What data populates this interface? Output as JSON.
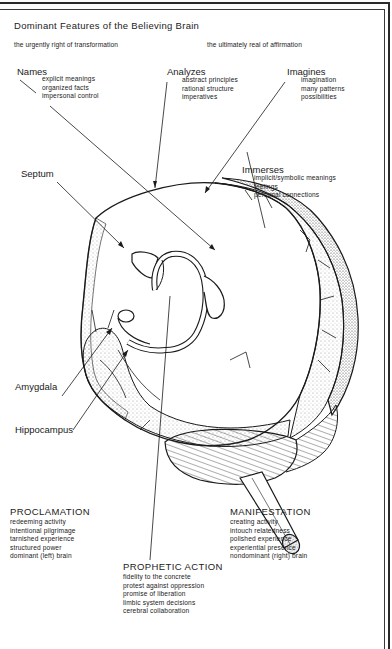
{
  "title": "Dominant Features of the Believing Brain",
  "subtitles": {
    "left": "the urgently right of transformation",
    "right": "the ultimately real of affirmation"
  },
  "callouts": {
    "names": {
      "heading": "Names",
      "items": [
        "explicit meanings",
        "organized facts",
        "impersonal control"
      ]
    },
    "analyzes": {
      "heading": "Analyzes",
      "items": [
        "abstract principles",
        "rational structure",
        "imperatives"
      ]
    },
    "imagines": {
      "heading": "Imagines",
      "items": [
        "imagination",
        "many patterns",
        "possibilities"
      ]
    },
    "immerses": {
      "heading": "Immerses",
      "items": [
        "implicit/symbolic meanings",
        "feelings",
        "personal connections"
      ]
    }
  },
  "anatomy_labels": {
    "septum": "Septum",
    "amygdala": "Amygdala",
    "hippocampus": "Hippocampus"
  },
  "sections": {
    "proclamation": {
      "heading": "PROCLAMATION",
      "items": [
        "redeeming activity",
        "intentional pilgrimage",
        "tarnished experience",
        "structured power",
        "dominant (left) brain"
      ]
    },
    "manifestation": {
      "heading": "MANIFESTATION",
      "items": [
        "creating activity",
        "intouch relatedness",
        "polished experience",
        "experiential presence",
        "nondominant (right) brain"
      ]
    },
    "prophetic_action": {
      "heading": "PROPHETIC ACTION",
      "items": [
        "fidelity to the concrete",
        "protest against oppression",
        "promise of liberation",
        "limbic system decisions",
        "cerebral collaboration"
      ]
    }
  },
  "colors": {
    "ink": "#1a1a1a",
    "paper": "#ffffff",
    "stipple": "#555555"
  }
}
